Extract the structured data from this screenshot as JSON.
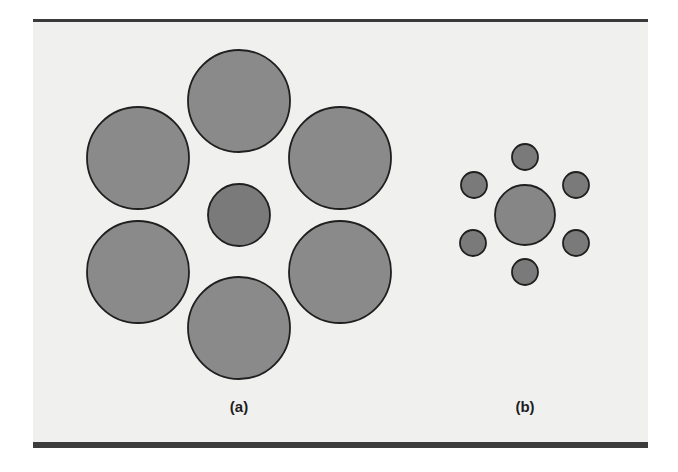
{
  "figure": {
    "background_color": "#f0f0ef",
    "border_color": "#3a3a3a",
    "panels": [
      {
        "id": "a",
        "label": "(a)",
        "label_pos": {
          "x": 239,
          "y": 398
        },
        "circles": [
          {
            "name": "top",
            "cx": 239,
            "cy": 101,
            "r": 51,
            "fill": "#8a8a8a"
          },
          {
            "name": "upper-left",
            "cx": 138,
            "cy": 158,
            "r": 51,
            "fill": "#8a8a8a"
          },
          {
            "name": "upper-right",
            "cx": 340,
            "cy": 158,
            "r": 51,
            "fill": "#8a8a8a"
          },
          {
            "name": "center",
            "cx": 239,
            "cy": 215,
            "r": 31,
            "fill": "#7a7a7a"
          },
          {
            "name": "lower-left",
            "cx": 138,
            "cy": 272,
            "r": 51,
            "fill": "#8a8a8a"
          },
          {
            "name": "lower-right",
            "cx": 340,
            "cy": 272,
            "r": 51,
            "fill": "#8a8a8a"
          },
          {
            "name": "bottom",
            "cx": 239,
            "cy": 328,
            "r": 51,
            "fill": "#8a8a8a"
          }
        ]
      },
      {
        "id": "b",
        "label": "(b)",
        "label_pos": {
          "x": 525,
          "y": 398
        },
        "circles": [
          {
            "name": "top",
            "cx": 525,
            "cy": 157,
            "r": 13,
            "fill": "#7a7a7a"
          },
          {
            "name": "upper-left",
            "cx": 474,
            "cy": 185,
            "r": 13,
            "fill": "#7a7a7a"
          },
          {
            "name": "upper-right",
            "cx": 576,
            "cy": 185,
            "r": 13,
            "fill": "#7a7a7a"
          },
          {
            "name": "center",
            "cx": 525,
            "cy": 215,
            "r": 30,
            "fill": "#868686"
          },
          {
            "name": "lower-left",
            "cx": 473,
            "cy": 243,
            "r": 13,
            "fill": "#7a7a7a"
          },
          {
            "name": "lower-right",
            "cx": 576,
            "cy": 243,
            "r": 13,
            "fill": "#7a7a7a"
          },
          {
            "name": "bottom",
            "cx": 525,
            "cy": 272,
            "r": 13,
            "fill": "#7a7a7a"
          }
        ]
      }
    ],
    "stroke_color": "#1f1f1f"
  }
}
